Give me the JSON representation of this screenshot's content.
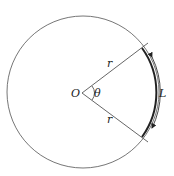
{
  "diagram": {
    "labels": {
      "center": "O",
      "angle": "θ",
      "radius_upper": "r",
      "radius_lower": "r",
      "arc": "L"
    },
    "colors": {
      "stroke": "#555555",
      "arc": "#222222",
      "text": "#222222"
    }
  }
}
